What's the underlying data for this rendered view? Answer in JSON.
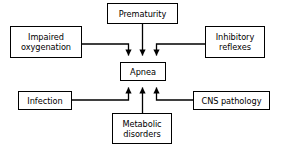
{
  "diagram": {
    "type": "flowchart",
    "canvas": {
      "width": 286,
      "height": 151,
      "background": "#ffffff"
    },
    "line_color": "#000000",
    "box_border_color": "#000000",
    "box_fill_color": "#ffffff",
    "text_color": "#000000",
    "nodes": [
      {
        "id": "prematurity",
        "label": "Prematurity",
        "role": "cause",
        "position": "top-center",
        "x": 107,
        "y": 3,
        "w": 71,
        "h": 21
      },
      {
        "id": "impaired-oxygenation",
        "label": "Impaired\noxygenation",
        "role": "cause",
        "position": "left-upper",
        "x": 10,
        "y": 26,
        "w": 72,
        "h": 32
      },
      {
        "id": "inhibitory-reflexes",
        "label": "Inhibitory\nreflexes",
        "role": "cause",
        "position": "right-upper",
        "x": 205,
        "y": 26,
        "w": 60,
        "h": 32
      },
      {
        "id": "apnea",
        "label": "Apnea",
        "role": "outcome",
        "position": "center",
        "x": 120,
        "y": 62,
        "w": 46,
        "h": 19
      },
      {
        "id": "infection",
        "label": "Infection",
        "role": "cause",
        "position": "left-lower",
        "x": 18,
        "y": 91,
        "w": 54,
        "h": 19
      },
      {
        "id": "cns-pathology",
        "label": "CNS pathology",
        "role": "cause",
        "position": "right-lower",
        "x": 193,
        "y": 91,
        "w": 77,
        "h": 19
      },
      {
        "id": "metabolic-disorders",
        "label": "Metabolic\ndisorders",
        "role": "cause",
        "position": "bottom-center",
        "x": 112,
        "y": 113,
        "w": 60,
        "h": 31
      }
    ],
    "edges": [
      {
        "id": "edge-prematurity-apnea",
        "from": "prematurity",
        "to": "apnea",
        "direction": "down",
        "arrow": true
      },
      {
        "id": "edge-impaired-oxygenation-apnea",
        "from": "impaired-oxygenation",
        "to": "apnea",
        "direction": "down",
        "arrow": true
      },
      {
        "id": "edge-inhibitory-reflexes-apnea",
        "from": "inhibitory-reflexes",
        "to": "apnea",
        "direction": "down",
        "arrow": true
      },
      {
        "id": "edge-infection-apnea",
        "from": "infection",
        "to": "apnea",
        "direction": "up",
        "arrow": true
      },
      {
        "id": "edge-cns-pathology-apnea",
        "from": "cns-pathology",
        "to": "apnea",
        "direction": "up",
        "arrow": true
      },
      {
        "id": "edge-metabolic-disorders-apnea",
        "from": "metabolic-disorders",
        "to": "apnea",
        "direction": "up",
        "arrow": true
      }
    ]
  }
}
